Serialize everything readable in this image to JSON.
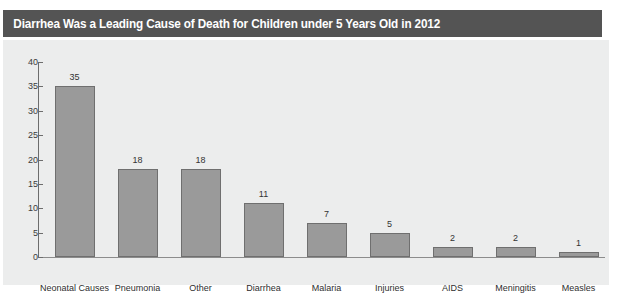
{
  "title": "Diarrhea Was a Leading Cause of Death for Children under 5 Years Old in 2012",
  "watermark": "",
  "colors": {
    "title_bar": "#545454",
    "title_text": "#ffffff",
    "panel_background": "#eceded",
    "bar_fill": "#9a9a9a",
    "bar_border": "#6f6f6f",
    "axis": "#6d6d6d",
    "tick_label": "#3b3b3b"
  },
  "chart_data": {
    "type": "bar",
    "title": "Diarrhea Was a Leading Cause of Death for Children under 5 Years Old in 2012",
    "subtitle": "",
    "xlabel": "",
    "ylabel": "",
    "categories": [
      "Neonatal Causes",
      "Pneumonia",
      "Other",
      "Diarrhea",
      "Malaria",
      "Injuries",
      "AIDS",
      "Meningitis",
      "Measles"
    ],
    "values": [
      35,
      18,
      18,
      11,
      7,
      5,
      2,
      2,
      1
    ],
    "data_labels": [
      "35",
      "18",
      "18",
      "11",
      "7",
      "5",
      "2",
      "2",
      "1"
    ],
    "ylim": [
      0,
      40
    ],
    "ytick_values": [
      0,
      5,
      10,
      15,
      20,
      25,
      30,
      35,
      40
    ],
    "ytick_labels": [
      "0",
      "5",
      "10",
      "15",
      "20",
      "25",
      "30",
      "35",
      "40"
    ],
    "grid": false,
    "legend": false,
    "legend_position": "none",
    "orientation": "vertical"
  }
}
